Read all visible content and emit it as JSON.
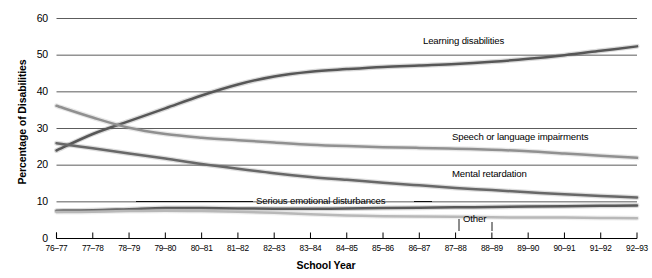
{
  "chart_data": {
    "type": "line",
    "title": "",
    "xlabel": "School Year",
    "ylabel": "Percentage of Disabilities",
    "grid": true,
    "legend_position": "inline-annotations",
    "ylim": [
      0,
      60
    ],
    "yticks": [
      0,
      10,
      20,
      30,
      40,
      50,
      60
    ],
    "categories": [
      "76–77",
      "77–78",
      "78–79",
      "79–80",
      "80–81",
      "81–82",
      "82–83",
      "83–84",
      "84–85",
      "85–86",
      "86–87",
      "87–88",
      "88–89",
      "89–90",
      "90–91",
      "91–92",
      "92–93"
    ],
    "series": [
      {
        "name": "Learning disabilities",
        "color": "#575757",
        "values": [
          24.0,
          28.5,
          32.0,
          35.5,
          39.0,
          42.0,
          44.2,
          45.5,
          46.2,
          46.8,
          47.2,
          47.6,
          48.2,
          49.0,
          50.0,
          51.2,
          52.4
        ]
      },
      {
        "name": "Speech or language impairments",
        "color": "#909090",
        "values": [
          36.2,
          33.0,
          30.2,
          28.5,
          27.5,
          26.8,
          26.2,
          25.6,
          25.2,
          24.9,
          24.7,
          24.5,
          24.2,
          23.8,
          23.2,
          22.6,
          22.0
        ]
      },
      {
        "name": "Mental retardation",
        "color": "#686868",
        "values": [
          26.0,
          24.6,
          23.2,
          21.8,
          20.3,
          19.0,
          17.8,
          16.8,
          16.0,
          15.2,
          14.5,
          13.8,
          13.2,
          12.6,
          12.1,
          11.6,
          11.2
        ]
      },
      {
        "name": "Serious emotional disturbances",
        "color": "#595959",
        "values": [
          7.6,
          7.7,
          8.0,
          8.3,
          8.3,
          8.2,
          8.1,
          8.1,
          8.2,
          8.3,
          8.4,
          8.5,
          8.6,
          8.7,
          8.8,
          8.9,
          9.0
        ]
      },
      {
        "name": "Other",
        "color": "#b8b8b8",
        "values": [
          7.2,
          7.3,
          7.5,
          7.6,
          7.5,
          7.3,
          7.0,
          6.6,
          6.3,
          6.1,
          6.0,
          5.9,
          5.8,
          5.7,
          5.7,
          5.6,
          5.5
        ]
      }
    ],
    "annotations": [
      {
        "text": "Learning disabilities",
        "series": "Learning disabilities"
      },
      {
        "text": "Speech or language impairments",
        "series": "Speech or language impairments"
      },
      {
        "text": "Mental retardation",
        "series": "Mental retardation"
      },
      {
        "text": "Serious emotional disturbances",
        "series": "Serious emotional disturbances"
      },
      {
        "text": "Other",
        "series": "Other"
      }
    ]
  },
  "axis": {
    "y_tick_labels": [
      "60",
      "50",
      "40",
      "30",
      "20",
      "10",
      "0"
    ],
    "x_tick_labels": [
      "76–77",
      "77–78",
      "78–79",
      "79–80",
      "80–81",
      "81–82",
      "82–83",
      "83–84",
      "84–85",
      "85–86",
      "86–87",
      "87–88",
      "88–89",
      "89–90",
      "90–91",
      "91–92",
      "92–93"
    ],
    "x_title": "School Year",
    "y_title": "Percentage of Disabilities"
  },
  "labels": {
    "learning_disabilities": "Learning disabilities",
    "speech_or_language": "Speech or language impairments",
    "mental_retardation": "Mental retardation",
    "serious_emotional": "Serious emotional disturbances",
    "other": "Other"
  }
}
